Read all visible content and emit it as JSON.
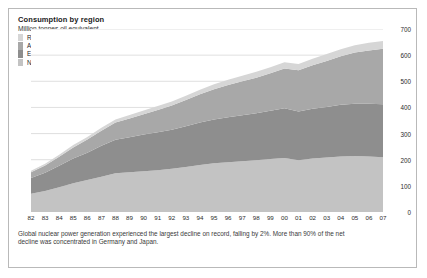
{
  "figure": {
    "title": "Consumption by region",
    "subtitle": "Million tonnes oil equivalent",
    "caption_line1": "Global nuclear power generation experienced the largest decline on record, falling by 2%. More than 90% of the net",
    "caption_line2": "decline was concentrated in Germany and Japan.",
    "border_color": "#b9b9b9"
  },
  "chart_data": {
    "type": "area",
    "title": "Consumption by region",
    "subtitle": "Million tonnes oil equivalent",
    "xlabel": "",
    "ylabel": "Million tonnes oil equivalent",
    "ylim": [
      0,
      700
    ],
    "yticks": [
      0,
      100,
      200,
      300,
      400,
      500,
      600,
      700
    ],
    "y_axis_position": "right",
    "grid": true,
    "legend_position": "top-left",
    "stacked": true,
    "stack_order_bottom_to_top": [
      "North America",
      "Europe & Eurasia",
      "Asia Pacific",
      "Rest of World"
    ],
    "x": [
      "82",
      "83",
      "84",
      "85",
      "86",
      "87",
      "88",
      "89",
      "90",
      "91",
      "92",
      "93",
      "94",
      "95",
      "96",
      "97",
      "98",
      "99",
      "00",
      "01",
      "02",
      "03",
      "04",
      "05",
      "06",
      "07"
    ],
    "x_full_years": [
      1982,
      1983,
      1984,
      1985,
      1986,
      1987,
      1988,
      1989,
      1990,
      1991,
      1992,
      1993,
      1994,
      1995,
      1996,
      1997,
      1998,
      1999,
      2000,
      2001,
      2002,
      2003,
      2004,
      2005,
      2006,
      2007
    ],
    "series": [
      {
        "name": "North America",
        "color": "#c3c3c3",
        "values": [
          70,
          80,
          95,
          110,
          122,
          135,
          148,
          152,
          156,
          160,
          165,
          172,
          180,
          186,
          190,
          194,
          198,
          203,
          207,
          198,
          205,
          208,
          212,
          214,
          212,
          209
        ]
      },
      {
        "name": "Europe & Eurasia",
        "color": "#8e8e8e",
        "values": [
          60,
          70,
          82,
          95,
          105,
          118,
          128,
          134,
          140,
          145,
          150,
          156,
          162,
          168,
          172,
          176,
          180,
          184,
          190,
          186,
          190,
          194,
          198,
          200,
          202,
          203
        ]
      },
      {
        "name": "Asia Pacific",
        "color": "#a8a8a8",
        "values": [
          22,
          28,
          34,
          42,
          50,
          58,
          66,
          72,
          78,
          85,
          92,
          100,
          108,
          116,
          124,
          130,
          136,
          144,
          152,
          158,
          166,
          176,
          186,
          196,
          204,
          212
        ]
      },
      {
        "name": "Rest of World",
        "color": "#d6d6d6",
        "values": [
          6,
          7,
          8,
          9,
          10,
          11,
          12,
          13,
          14,
          15,
          16,
          17,
          18,
          19,
          20,
          21,
          22,
          23,
          24,
          24,
          25,
          26,
          27,
          28,
          29,
          30
        ]
      }
    ],
    "totals": [
      158,
      185,
      219,
      256,
      287,
      322,
      354,
      371,
      388,
      405,
      423,
      445,
      468,
      489,
      506,
      521,
      536,
      554,
      573,
      566,
      586,
      604,
      623,
      638,
      647,
      654
    ]
  },
  "legend": {
    "items": [
      {
        "label": "Rest of World",
        "color": "#d6d6d6"
      },
      {
        "label": "Asia Pacific",
        "color": "#a8a8a8"
      },
      {
        "label": "Europe & Eurasia",
        "color": "#8e8e8e"
      },
      {
        "label": "North America",
        "color": "#c3c3c3"
      }
    ]
  },
  "axes": {
    "y_ticks": [
      "700",
      "600",
      "500",
      "400",
      "300",
      "200",
      "100",
      "0"
    ],
    "x_ticks": [
      "82",
      "83",
      "84",
      "85",
      "86",
      "87",
      "88",
      "89",
      "90",
      "91",
      "92",
      "93",
      "94",
      "95",
      "96",
      "97",
      "98",
      "99",
      "00",
      "01",
      "02",
      "03",
      "04",
      "05",
      "06",
      "07"
    ]
  }
}
